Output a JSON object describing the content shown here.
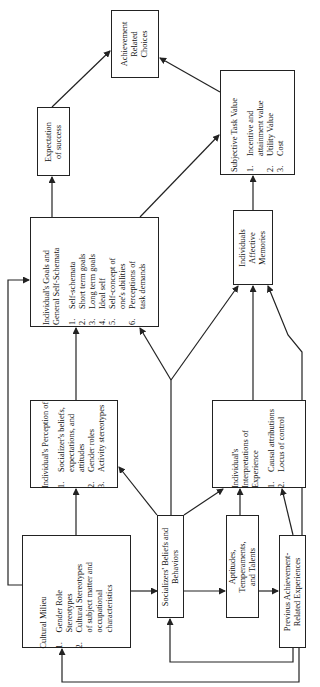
{
  "diagram": {
    "boxes": {
      "cultural_milieu": {
        "title": "Cultural Milieu",
        "items": [
          {
            "n": "1.",
            "text": "Gender Role\nStereotypes"
          },
          {
            "n": "2.",
            "text": "Cultural Stereotypes\nof subject matter and\noccupational\ncharacteristics"
          }
        ]
      },
      "socializers_beliefs": {
        "title": "Socializers' Beliefs and\nBehaviors"
      },
      "aptitudes": {
        "title": "Aptitudes,\nTemperaments,\nand Talents"
      },
      "previous_achievement": {
        "title": "Previous Achievement-\nRelated Experiences"
      },
      "perception": {
        "title": "Individual's Perception of",
        "items": [
          {
            "n": "1.",
            "text": "Socializer's beliefs,\nexpectations, and\nattitudes"
          },
          {
            "n": "2.",
            "text": "Gender roles"
          },
          {
            "n": "3.",
            "text": "Activity stereotypes"
          }
        ]
      },
      "interpretations": {
        "title": "Individual's\nInterpretations of\nExperience",
        "items": [
          {
            "n": "1.",
            "text": "Causal attributions"
          },
          {
            "n": "2.",
            "text": "Locus of control"
          }
        ]
      },
      "goals": {
        "title": "Individual's Goals and\nGeneral Self-Schemata",
        "items": [
          {
            "n": "1.",
            "text": "Self-schemata"
          },
          {
            "n": "2.",
            "text": "Short term goals"
          },
          {
            "n": "3.",
            "text": "Long term goals"
          },
          {
            "n": "4.",
            "text": "Ideal self"
          },
          {
            "n": "5.",
            "text": "Self-concept of\none's abilities"
          },
          {
            "n": "6.",
            "text": "Perceptions of\ntask demands"
          }
        ]
      },
      "affective_memories": {
        "title": "Individuals\nAffective\nMemories"
      },
      "expectation": {
        "title": "Expectation\nof success"
      },
      "task_value": {
        "title": "Subjective Task Value",
        "items": [
          {
            "n": "1.",
            "text": "Incentive and\nattainment value"
          },
          {
            "n": "2.",
            "text": "Utility Value"
          },
          {
            "n": "3.",
            "text": "Cost"
          }
        ]
      },
      "achievement_choices": {
        "title": "Achievement\nRelated\nChoices"
      }
    },
    "colors": {
      "line": "#222222",
      "background": "#ffffff"
    }
  }
}
